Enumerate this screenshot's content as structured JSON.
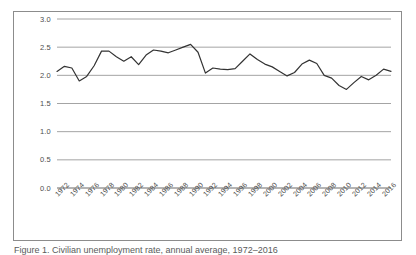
{
  "figure": {
    "caption": "Figure 1. Civilian unemployment rate, annual average, 1972–2016"
  },
  "chart_data": {
    "type": "line",
    "title": "",
    "xlabel": "",
    "ylabel": "",
    "ylim": [
      0.0,
      3.0
    ],
    "ytick_labels": [
      "3.0",
      "2.5",
      "2.0",
      "1.5",
      "1.0",
      "0.5",
      "0.0"
    ],
    "ytick_values": [
      3.0,
      2.5,
      2.0,
      1.5,
      1.0,
      0.5,
      0.0
    ],
    "grid": true,
    "grid_axis": "y",
    "legend": false,
    "legend_position": "none",
    "xtick_labels": [
      "1972",
      "1974",
      "1976",
      "1978",
      "1980",
      "1982",
      "1984",
      "1986",
      "1988",
      "1990",
      "1992",
      "1994",
      "1996",
      "1998",
      "2000",
      "2002",
      "2004",
      "2006",
      "2008",
      "2010",
      "2012",
      "2014",
      "2016"
    ],
    "xtick_step": 2,
    "x": [
      1972,
      1973,
      1974,
      1975,
      1976,
      1977,
      1978,
      1979,
      1980,
      1981,
      1982,
      1983,
      1984,
      1985,
      1986,
      1987,
      1988,
      1989,
      1990,
      1991,
      1992,
      1993,
      1994,
      1995,
      1996,
      1997,
      1998,
      1999,
      2000,
      2001,
      2002,
      2003,
      2004,
      2005,
      2006,
      2007,
      2008,
      2009,
      2010,
      2011,
      2012,
      2013,
      2014,
      2015,
      2016,
      2017
    ],
    "values": [
      2.07,
      2.16,
      2.13,
      1.9,
      1.98,
      2.17,
      2.43,
      2.43,
      2.33,
      2.25,
      2.33,
      2.19,
      2.36,
      2.45,
      2.43,
      2.4,
      2.45,
      2.5,
      2.55,
      2.41,
      2.04,
      2.13,
      2.11,
      2.1,
      2.12,
      2.25,
      2.38,
      2.28,
      2.2,
      2.15,
      2.07,
      1.99,
      2.05,
      2.2,
      2.27,
      2.21,
      2.0,
      1.95,
      1.82,
      1.75,
      1.87,
      1.98,
      1.92,
      2.0,
      2.11,
      2.07
    ],
    "line_color": "#333333",
    "line_width": 1.2,
    "grid_color": "#9a9a9a",
    "series": [
      {
        "name": "Series 1",
        "values": [
          2.07,
          2.16,
          2.13,
          1.9,
          1.98,
          2.17,
          2.43,
          2.43,
          2.33,
          2.25,
          2.33,
          2.19,
          2.36,
          2.45,
          2.43,
          2.4,
          2.45,
          2.5,
          2.55,
          2.41,
          2.04,
          2.13,
          2.11,
          2.1,
          2.12,
          2.25,
          2.38,
          2.28,
          2.2,
          2.15,
          2.07,
          1.99,
          2.05,
          2.2,
          2.27,
          2.21,
          2.0,
          1.95,
          1.82,
          1.75,
          1.87,
          1.98,
          1.92,
          2.0,
          2.11,
          2.07
        ]
      }
    ],
    "data_min": 1.75,
    "data_max": 2.55
  }
}
